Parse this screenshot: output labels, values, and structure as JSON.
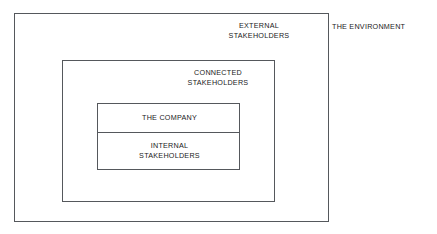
{
  "diagram": {
    "type": "nested-rectangles",
    "title_label": "THE ENVIRONMENT",
    "stroke_color": "#55585c",
    "text_color": "#1a1a1a",
    "background_color": "#ffffff",
    "layers": [
      {
        "id": "environment",
        "label": "THE ENVIRONMENT",
        "position": "outside-right"
      },
      {
        "id": "external",
        "label_line_1": "EXTERNAL",
        "label_line_2": "STAKEHOLDERS"
      },
      {
        "id": "connected",
        "label_line_1": "CONNECTED",
        "label_line_2": "STAKEHOLDERS"
      },
      {
        "id": "company",
        "label_line_1": "THE COMPANY"
      },
      {
        "id": "internal",
        "label_line_1": "INTERNAL",
        "label_line_2": "STAKEHOLDERS"
      }
    ]
  }
}
